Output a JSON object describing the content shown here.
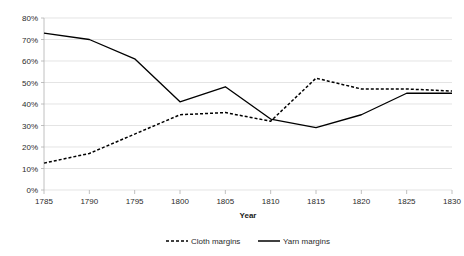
{
  "chart_data": {
    "type": "line",
    "title": "",
    "subtitle": "",
    "xlabel": "Year",
    "ylabel": "",
    "x": [
      1785,
      1790,
      1795,
      1800,
      1805,
      1810,
      1815,
      1820,
      1825,
      1830
    ],
    "xtick_labels": [
      "1785",
      "1790",
      "1795",
      "1800",
      "1805",
      "1810",
      "1815",
      "1820",
      "1825",
      "1830"
    ],
    "ytick_labels": [
      "0%",
      "10%",
      "20%",
      "30%",
      "40%",
      "50%",
      "60%",
      "70%",
      "80%"
    ],
    "ytick_values": [
      0,
      10,
      20,
      30,
      40,
      50,
      60,
      70,
      80
    ],
    "xlim": [
      1785,
      1830
    ],
    "ylim": [
      0,
      80
    ],
    "grid": "horizontal",
    "legend_position": "bottom",
    "series": [
      {
        "name": "Cloth margins",
        "style": "dashed",
        "color": "#000000",
        "values": [
          12.5,
          17,
          26,
          35,
          36,
          32,
          52,
          47,
          47,
          46
        ]
      },
      {
        "name": "Yarn margins",
        "style": "solid",
        "color": "#000000",
        "values": [
          73,
          70,
          61,
          41,
          48,
          33,
          29,
          35,
          45,
          45
        ]
      }
    ]
  },
  "legend": {
    "items": [
      {
        "label": "Cloth margins",
        "style": "dashed"
      },
      {
        "label": "Yarn margins",
        "style": "solid"
      }
    ]
  },
  "axes": {
    "x_title": "Year"
  }
}
